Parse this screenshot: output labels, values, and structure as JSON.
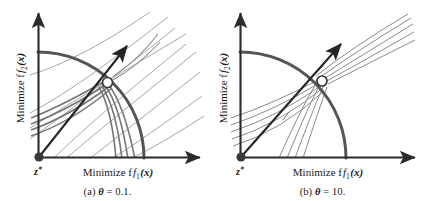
{
  "figure": {
    "type": "diagram",
    "panels": [
      {
        "id": "a",
        "caption_prefix": "(a)",
        "caption_symbol": "θ",
        "caption_value": "= 0.1.",
        "caption_full": "(a) θ = 0.1.",
        "axis_x_label": "Minimize f",
        "axis_x_sub": "1",
        "axis_x_arg": "(x)",
        "axis_y_label": "Minimize f",
        "axis_y_sub": "2",
        "axis_y_arg": "(x)",
        "origin_label": "z",
        "origin_star": "*",
        "contour_count": 9,
        "contour_angle_deg": -45,
        "reference_ray_angle_deg": 45
      },
      {
        "id": "b",
        "caption_prefix": "(b)",
        "caption_symbol": "θ",
        "caption_value": "= 10.",
        "caption_full": "(b) θ = 10.",
        "axis_x_label": "Minimize f",
        "axis_x_sub": "1",
        "axis_x_arg": "(x)",
        "axis_y_label": "Minimize f",
        "axis_y_sub": "2",
        "axis_y_arg": "(x)",
        "origin_label": "z",
        "origin_star": "*",
        "contour_count": 7,
        "contour_angle_deg": 40,
        "reference_ray_angle_deg": 45
      }
    ],
    "colors": {
      "axis": "#2b2b2b",
      "pareto_front": "#555555",
      "contour_thin": "#8a8a8a",
      "contour_thick": "#6e6e6e",
      "ray": "#262626",
      "origin_dot": "#3a3a3a",
      "solution_point_fill": "#ffffff",
      "solution_point_stroke": "#3a3a3a",
      "background": "#ffffff"
    }
  }
}
